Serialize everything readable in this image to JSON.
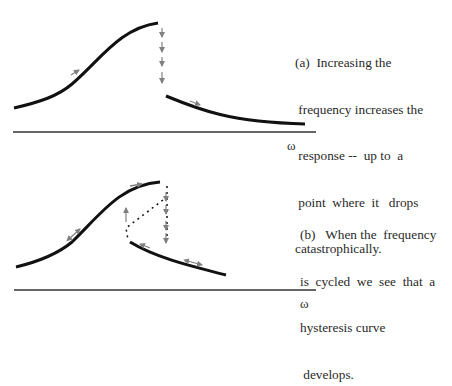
{
  "panels": [
    {
      "id": "a",
      "caption_lines": [
        "(a)  Increasing the",
        " frequency increases the",
        " response --  up to  a",
        " point  where  it   drops",
        "catastrophically."
      ],
      "axis_label": "ω"
    },
    {
      "id": "b",
      "caption_lines": [
        "(b)   When the  frequency",
        "is  cycled  we  see  that  a",
        "hysteresis curve",
        " develops."
      ],
      "axis_label": "ω"
    }
  ],
  "colors": {
    "curve": "#111111",
    "arrow": "#808080",
    "axis": "#333333",
    "text": "#2a2a2a"
  }
}
